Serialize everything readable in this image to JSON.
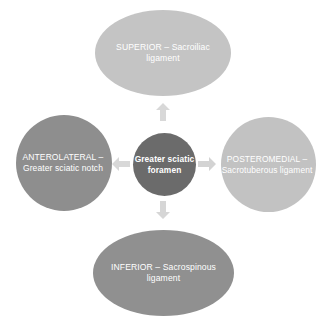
{
  "diagram": {
    "type": "radial-relationship-diagram",
    "center": {
      "name": "greater-sciatic-foramen",
      "label": "Greater sciatic foramen",
      "color": "#6b6b6b",
      "shape": "circle"
    },
    "nodes": [
      {
        "name": "superior",
        "position": "top",
        "label": "SUPERIOR – Sacroiliac ligament",
        "direction": "SUPERIOR",
        "structure": "Sacroiliac ligament",
        "color": "#c4c4c4",
        "shape": "ellipse"
      },
      {
        "name": "anterolateral",
        "position": "left",
        "label": "ANTEROLATERAL – Greater sciatic notch",
        "direction": "ANTEROLATERAL",
        "structure": "Greater sciatic notch",
        "color": "#8e8e8e",
        "shape": "circle"
      },
      {
        "name": "posteromedial",
        "position": "right",
        "label": "POSTEROMEDIAL – Sacrotuberous ligament",
        "direction": "POSTEROMEDIAL",
        "structure": "Sacrotuberous ligament",
        "color": "#c2c2c2",
        "shape": "circle"
      },
      {
        "name": "inferior",
        "position": "bottom",
        "label": "INFERIOR – Sacrospinous ligament",
        "direction": "INFERIOR",
        "structure": "Sacrospinous ligament",
        "color": "#909090",
        "shape": "ellipse"
      }
    ],
    "connectors": [
      {
        "name": "arrow-up",
        "points": "up",
        "color": "#d8d8d8"
      },
      {
        "name": "arrow-right",
        "points": "right",
        "color": "#d3d3d3"
      },
      {
        "name": "arrow-down",
        "points": "down",
        "color": "#d6d6d6"
      },
      {
        "name": "arrow-left",
        "points": "left",
        "color": "#d8d8d8"
      }
    ]
  }
}
